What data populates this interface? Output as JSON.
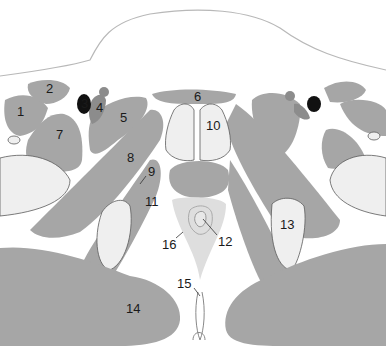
{
  "figure": {
    "type": "anatomical cross-section",
    "colors": {
      "muscle": "#a6a6a6",
      "bone": "#efefef",
      "vein": "#8c8c8c",
      "artery": "#111111",
      "background": "#ffffff"
    },
    "labels": [
      {
        "id": "1",
        "text": "1"
      },
      {
        "id": "2",
        "text": "2"
      },
      {
        "id": "3",
        "text": "3"
      },
      {
        "id": "4",
        "text": "4"
      },
      {
        "id": "5",
        "text": "5"
      },
      {
        "id": "6",
        "text": "6"
      },
      {
        "id": "7",
        "text": "7"
      },
      {
        "id": "8",
        "text": "8"
      },
      {
        "id": "9",
        "text": "9"
      },
      {
        "id": "10",
        "text": "10"
      },
      {
        "id": "11",
        "text": "11"
      },
      {
        "id": "12",
        "text": "12"
      },
      {
        "id": "13",
        "text": "13"
      },
      {
        "id": "14",
        "text": "14"
      },
      {
        "id": "15",
        "text": "15"
      },
      {
        "id": "16",
        "text": "16"
      }
    ]
  }
}
